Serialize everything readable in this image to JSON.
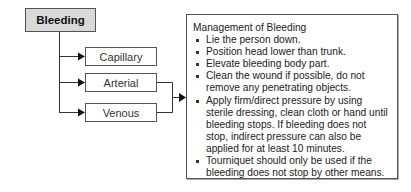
{
  "diagram": {
    "root": {
      "label": "Bleeding",
      "fill": "#d9d9d9"
    },
    "types": [
      {
        "label": "Capillary"
      },
      {
        "label": "Arterial"
      },
      {
        "label": "Venous"
      }
    ],
    "management": {
      "title": "Management of Bleeding",
      "steps": [
        "Lie the person down.",
        "Position head lower than trunk.",
        "Elevate bleeding body part.",
        "Clean the wound if possible, do not remove any penetrating objects.",
        "Apply firm/direct pressure by using sterile dressing, clean cloth or hand until bleeding stops. If bleeding does not stop, indirect pressure can also be applied for at least 10 minutes.",
        "Tourniquet should only be used if the bleeding does not stop by other means."
      ]
    },
    "connections": [
      {
        "from": "Bleeding",
        "to": "Capillary"
      },
      {
        "from": "Bleeding",
        "to": "Arterial"
      },
      {
        "from": "Bleeding",
        "to": "Venous"
      },
      {
        "from": "Arterial",
        "to": "Management of Bleeding"
      },
      {
        "from": "Venous",
        "to": "Management of Bleeding"
      }
    ]
  }
}
